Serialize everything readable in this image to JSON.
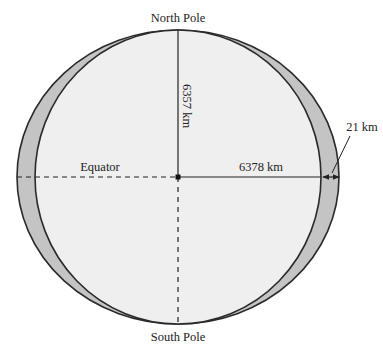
{
  "diagram": {
    "labels": {
      "north_pole": "North Pole",
      "south_pole": "South Pole",
      "equator": "Equator",
      "polar_radius": "6357 km",
      "equatorial_radius": "6378 km",
      "difference": "21 km"
    },
    "colors": {
      "background": "#ffffff",
      "bulge_fill": "#c4c4c4",
      "sphere_fill": "#efefef",
      "outline": "#2a2a2a"
    }
  }
}
